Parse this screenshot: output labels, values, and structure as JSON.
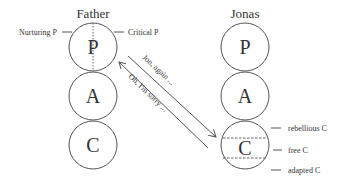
{
  "figure": {
    "father": {
      "title": "Father",
      "states": [
        "P",
        "A",
        "C"
      ],
      "labels": {
        "left": "Nurturing P",
        "right": "Critical P"
      }
    },
    "jonas": {
      "title": "Jonas",
      "states": [
        "P",
        "A",
        "C"
      ],
      "labels": {
        "top": "rebellious C",
        "middle": "free C",
        "bottom": "adapted C"
      }
    },
    "transactions": [
      {
        "text": "Jon, again ...",
        "direction": "father-P to jonas-C"
      },
      {
        "text": "Oh, I'm sorry ...",
        "direction": "jonas-C to father-P"
      }
    ],
    "colors": {
      "stroke": "#555555",
      "text": "#333333"
    }
  }
}
